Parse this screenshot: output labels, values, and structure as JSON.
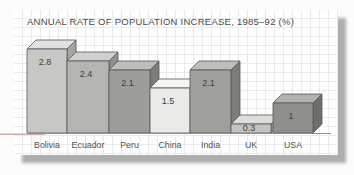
{
  "window": {
    "background": "#fcfcfc"
  },
  "card": {
    "background": "#ffffff",
    "grid_line_color": "#e8eaeb",
    "shadow_color": "#aeaeae"
  },
  "chart_data": {
    "type": "bar",
    "title": "ANNUAL RATE OF POPULATION INCREASE, 1985–92 (%)",
    "categories": [
      "Bolivia",
      "Ecuador",
      "Peru",
      "China",
      "India",
      "UK",
      "USA"
    ],
    "values": [
      2.8,
      2.4,
      2.1,
      1.5,
      2.1,
      0.3,
      1
    ],
    "value_labels": [
      "2.8",
      "2.4",
      "2.1",
      "1.5",
      "2.1",
      "0.3",
      "1"
    ],
    "xlabel": "",
    "ylabel": "",
    "ylim": [
      0,
      3
    ],
    "grid": "graph-paper card background, no plot gridlines",
    "legend": "none",
    "bar_style": "3d-blocks",
    "bar_colors": [
      {
        "front": "#c7c8c4",
        "top": "#e1e2de",
        "side": "#a4a5a1"
      },
      {
        "front": "#b4b5b1",
        "top": "#d0d1cd",
        "side": "#8f908c"
      },
      {
        "front": "#9d9e9a",
        "top": "#bebfba",
        "side": "#7c7d79"
      },
      {
        "front": "#eaeae6",
        "top": "#f6f6f2",
        "side": "#cccdc8"
      },
      {
        "front": "#9fa09c",
        "top": "#bebfba",
        "side": "#7c7d79"
      },
      {
        "front": "#c3c4c0",
        "top": "#dddeda",
        "side": "#9a9b97"
      },
      {
        "front": "#8f908c",
        "top": "#b2b3ae",
        "side": "#6e6f6b"
      }
    ],
    "outline_color": "#55565a",
    "baseline_color": "#909090",
    "stray_line_color": "#ccafa8",
    "value_label_color": "#3d3d3d",
    "category_label_color": "#525252"
  }
}
